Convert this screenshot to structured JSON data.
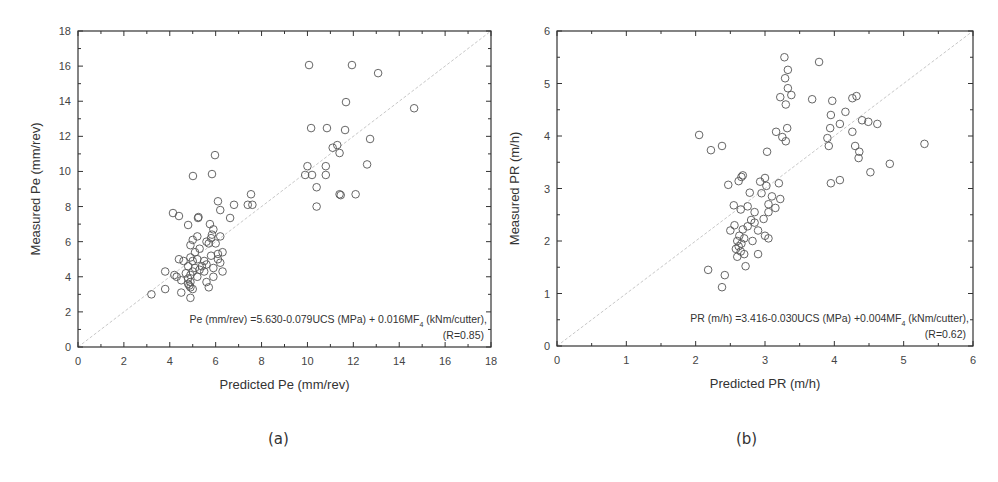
{
  "chart_data": [
    {
      "id": "a",
      "type": "scatter",
      "caption": "(a)",
      "title": "",
      "xlabel": "Predicted Pe (mm/rev)",
      "ylabel": "Measured Pe (mm/rev)",
      "xlim": [
        0,
        18
      ],
      "ylim": [
        0,
        18
      ],
      "xticks": [
        0,
        2,
        4,
        6,
        8,
        10,
        12,
        14,
        16,
        18
      ],
      "yticks": [
        0,
        2,
        4,
        6,
        8,
        10,
        12,
        14,
        16,
        18
      ],
      "grid": false,
      "reference_line": "y = x",
      "annotation_line1": "Pe (mm/rev) =5.630-0.079UCS (MPa) + 0.016MF",
      "annotation_sub": "4",
      "annotation_line1_tail": " (kNm/cutter),",
      "annotation_line2": "(R=0.85)",
      "points": [
        [
          10.07,
          16.06
        ],
        [
          11.94,
          16.06
        ],
        [
          13.08,
          15.6
        ],
        [
          11.68,
          13.95
        ],
        [
          14.65,
          13.6
        ],
        [
          10.16,
          12.47
        ],
        [
          10.85,
          12.47
        ],
        [
          11.64,
          12.36
        ],
        [
          12.73,
          11.85
        ],
        [
          11.1,
          11.35
        ],
        [
          11.3,
          11.5
        ],
        [
          11.4,
          11.05
        ],
        [
          12.6,
          10.4
        ],
        [
          10.0,
          10.3
        ],
        [
          10.8,
          10.3
        ],
        [
          9.9,
          9.8
        ],
        [
          10.2,
          9.8
        ],
        [
          10.8,
          9.8
        ],
        [
          10.4,
          9.1
        ],
        [
          11.4,
          8.7
        ],
        [
          11.45,
          8.65
        ],
        [
          12.1,
          8.7
        ],
        [
          10.4,
          8.0
        ],
        [
          5.97,
          10.93
        ],
        [
          5.01,
          9.74
        ],
        [
          5.84,
          9.85
        ],
        [
          4.14,
          7.63
        ],
        [
          4.4,
          7.46
        ],
        [
          5.23,
          7.35
        ],
        [
          5.25,
          7.4
        ],
        [
          4.8,
          6.95
        ],
        [
          6.1,
          8.3
        ],
        [
          6.2,
          7.8
        ],
        [
          6.8,
          8.1
        ],
        [
          7.54,
          8.7
        ],
        [
          7.4,
          8.1
        ],
        [
          7.6,
          8.1
        ],
        [
          6.63,
          7.35
        ],
        [
          5.75,
          7.0
        ],
        [
          5.84,
          6.4
        ],
        [
          5.6,
          6.0
        ],
        [
          5.9,
          6.7
        ],
        [
          6.2,
          6.3
        ],
        [
          5.7,
          5.9
        ],
        [
          6.0,
          5.9
        ],
        [
          6.3,
          5.4
        ],
        [
          6.1,
          5.3
        ],
        [
          5.8,
          5.2
        ],
        [
          6.2,
          4.8
        ],
        [
          6.3,
          4.3
        ],
        [
          5.9,
          4.5
        ],
        [
          5.2,
          6.3
        ],
        [
          5.0,
          6.1
        ],
        [
          4.9,
          5.8
        ],
        [
          5.3,
          5.6
        ],
        [
          5.1,
          5.4
        ],
        [
          4.9,
          5.1
        ],
        [
          5.2,
          5.0
        ],
        [
          5.5,
          4.9
        ],
        [
          5.6,
          4.7
        ],
        [
          5.4,
          4.6
        ],
        [
          5.0,
          4.9
        ],
        [
          4.8,
          4.6
        ],
        [
          5.1,
          4.5
        ],
        [
          5.3,
          4.4
        ],
        [
          5.0,
          4.3
        ],
        [
          4.7,
          4.2
        ],
        [
          4.9,
          4.1
        ],
        [
          5.2,
          4.0
        ],
        [
          4.8,
          3.9
        ],
        [
          4.9,
          3.7
        ],
        [
          4.85,
          3.5
        ],
        [
          4.9,
          3.4
        ],
        [
          5.0,
          3.3
        ],
        [
          4.8,
          3.6
        ],
        [
          4.5,
          3.8
        ],
        [
          4.2,
          4.1
        ],
        [
          4.3,
          4.0
        ],
        [
          3.8,
          4.3
        ],
        [
          3.8,
          3.3
        ],
        [
          3.2,
          3.0
        ],
        [
          4.4,
          5.0
        ],
        [
          4.6,
          4.9
        ],
        [
          5.6,
          3.7
        ],
        [
          5.7,
          3.4
        ],
        [
          5.9,
          4.0
        ],
        [
          4.5,
          3.1
        ],
        [
          4.9,
          2.8
        ],
        [
          5.5,
          4.3
        ],
        [
          6.1,
          5.0
        ],
        [
          5.8,
          6.2
        ]
      ]
    },
    {
      "id": "b",
      "type": "scatter",
      "caption": "(b)",
      "title": "",
      "xlabel": "Predicted PR (m/h)",
      "ylabel": "Measured PR (m/h)",
      "xlim": [
        0,
        6
      ],
      "ylim": [
        0,
        6
      ],
      "xticks": [
        0,
        1,
        2,
        3,
        4,
        5,
        6
      ],
      "yticks": [
        0,
        1,
        2,
        3,
        4,
        5,
        6
      ],
      "grid": false,
      "reference_line": "y = x",
      "annotation_line1": "PR (m/h) =3.416-0.030UCS (MPa) +0.004MF",
      "annotation_sub": "4",
      "annotation_line1_tail": " (kNm/cutter),",
      "annotation_line2": "(R=0.62)",
      "points": [
        [
          3.28,
          5.5
        ],
        [
          3.78,
          5.41
        ],
        [
          3.33,
          5.26
        ],
        [
          3.29,
          5.1
        ],
        [
          3.33,
          4.91
        ],
        [
          3.38,
          4.78
        ],
        [
          3.22,
          4.74
        ],
        [
          3.3,
          4.6
        ],
        [
          3.68,
          4.7
        ],
        [
          2.05,
          4.02
        ],
        [
          2.22,
          3.73
        ],
        [
          2.38,
          3.81
        ],
        [
          3.16,
          4.08
        ],
        [
          3.32,
          4.15
        ],
        [
          3.25,
          3.98
        ],
        [
          3.3,
          3.9
        ],
        [
          3.03,
          3.7
        ],
        [
          3.97,
          4.67
        ],
        [
          4.26,
          4.72
        ],
        [
          4.32,
          4.76
        ],
        [
          3.95,
          4.4
        ],
        [
          4.16,
          4.46
        ],
        [
          4.08,
          4.23
        ],
        [
          3.94,
          4.15
        ],
        [
          4.4,
          4.3
        ],
        [
          4.49,
          4.27
        ],
        [
          4.62,
          4.23
        ],
        [
          4.26,
          4.08
        ],
        [
          3.9,
          3.96
        ],
        [
          3.92,
          3.81
        ],
        [
          4.3,
          3.81
        ],
        [
          4.36,
          3.7
        ],
        [
          4.35,
          3.58
        ],
        [
          5.3,
          3.85
        ],
        [
          4.8,
          3.47
        ],
        [
          4.52,
          3.31
        ],
        [
          3.95,
          3.1
        ],
        [
          4.08,
          3.16
        ],
        [
          2.47,
          3.07
        ],
        [
          2.62,
          3.14
        ],
        [
          2.66,
          3.22
        ],
        [
          2.68,
          3.25
        ],
        [
          2.93,
          3.13
        ],
        [
          3.0,
          3.2
        ],
        [
          2.78,
          2.92
        ],
        [
          2.95,
          2.91
        ],
        [
          3.02,
          3.05
        ],
        [
          2.55,
          2.68
        ],
        [
          2.65,
          2.6
        ],
        [
          2.75,
          2.66
        ],
        [
          3.05,
          2.7
        ],
        [
          3.1,
          2.85
        ],
        [
          3.15,
          2.63
        ],
        [
          3.22,
          2.8
        ],
        [
          2.85,
          2.55
        ],
        [
          2.5,
          2.2
        ],
        [
          2.56,
          2.3
        ],
        [
          2.68,
          2.22
        ],
        [
          2.75,
          2.28
        ],
        [
          2.85,
          2.35
        ],
        [
          2.98,
          2.42
        ],
        [
          3.05,
          2.55
        ],
        [
          2.63,
          2.1
        ],
        [
          2.6,
          2.0
        ],
        [
          2.62,
          1.9
        ],
        [
          2.66,
          1.95
        ],
        [
          2.7,
          2.05
        ],
        [
          2.58,
          1.85
        ],
        [
          2.65,
          1.8
        ],
        [
          2.7,
          1.75
        ],
        [
          2.6,
          1.7
        ],
        [
          2.82,
          2.0
        ],
        [
          2.9,
          1.75
        ],
        [
          2.72,
          1.52
        ],
        [
          2.18,
          1.45
        ],
        [
          2.42,
          1.35
        ],
        [
          2.38,
          1.12
        ],
        [
          3.0,
          2.1
        ],
        [
          3.05,
          2.05
        ],
        [
          2.9,
          2.2
        ],
        [
          2.8,
          2.4
        ],
        [
          3.2,
          3.1
        ]
      ]
    }
  ]
}
